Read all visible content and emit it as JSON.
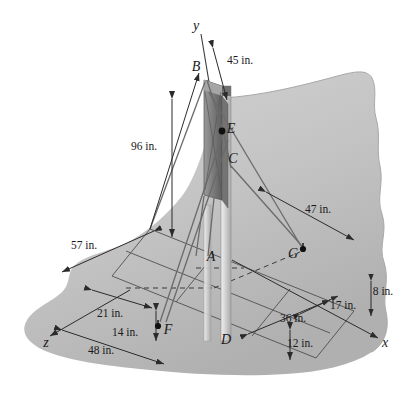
{
  "figure": {
    "colors": {
      "ground_light": "#cfcfcf",
      "ground_mid": "#bdbdbd",
      "ground_dark": "#ababab",
      "panel_dark": "#6e6e6e",
      "panel_mid": "#8f8f8f",
      "pole_light": "#d8d8d8",
      "ink": "#1a1a1a",
      "line": "#3a3a3a"
    },
    "axes": [
      {
        "name": "y-axis",
        "label": "y",
        "x": 196,
        "y": 26
      },
      {
        "name": "x-axis",
        "label": "x",
        "x": 385,
        "y": 343
      },
      {
        "name": "z-axis",
        "label": "z",
        "x": 46,
        "y": 343
      }
    ],
    "points": [
      {
        "name": "point-B",
        "label": "B",
        "x": 196,
        "y": 67,
        "dot": false
      },
      {
        "name": "point-E",
        "label": "E",
        "x": 231,
        "y": 129,
        "dot": true,
        "dot_x": 222,
        "dot_y": 131
      },
      {
        "name": "point-C",
        "label": "C",
        "x": 233,
        "y": 159,
        "dot": false
      },
      {
        "name": "point-A",
        "label": "A",
        "x": 211,
        "y": 257,
        "dot": false
      },
      {
        "name": "point-D",
        "label": "D",
        "x": 226,
        "y": 340,
        "dot": false
      },
      {
        "name": "point-G",
        "label": "G",
        "x": 293,
        "y": 254,
        "dot": true,
        "dot_x": 303,
        "dot_y": 249
      },
      {
        "name": "point-F",
        "label": "F",
        "x": 168,
        "y": 330,
        "dot": true,
        "dot_x": 158,
        "dot_y": 326
      }
    ],
    "dimensions": [
      {
        "name": "dim-45in",
        "label": "45 in.",
        "x": 240,
        "y": 60,
        "value": 45,
        "unit": "in."
      },
      {
        "name": "dim-96in",
        "label": "96 in.",
        "x": 144,
        "y": 146,
        "value": 96,
        "unit": "in."
      },
      {
        "name": "dim-57in",
        "label": "57 in.",
        "x": 84,
        "y": 245,
        "value": 57,
        "unit": "in."
      },
      {
        "name": "dim-47in",
        "label": "47 in.",
        "x": 318,
        "y": 209,
        "value": 47,
        "unit": "in."
      },
      {
        "name": "dim-21in",
        "label": "21 in.",
        "x": 110,
        "y": 313,
        "value": 21,
        "unit": "in."
      },
      {
        "name": "dim-14in",
        "label": "14 in.",
        "x": 125,
        "y": 332,
        "value": 14,
        "unit": "in."
      },
      {
        "name": "dim-48in",
        "label": "48 in.",
        "x": 101,
        "y": 350,
        "value": 48,
        "unit": "in."
      },
      {
        "name": "dim-36in",
        "label": "36 in.",
        "x": 293,
        "y": 318,
        "value": 36,
        "unit": "in."
      },
      {
        "name": "dim-12in",
        "label": "12 in.",
        "x": 300,
        "y": 343,
        "value": 12,
        "unit": "in."
      },
      {
        "name": "dim-17in",
        "label": "17 in.",
        "x": 343,
        "y": 305,
        "value": 17,
        "unit": "in."
      },
      {
        "name": "dim-8in",
        "label": "8 in.",
        "x": 383,
        "y": 291,
        "value": 8,
        "unit": "in."
      }
    ]
  }
}
